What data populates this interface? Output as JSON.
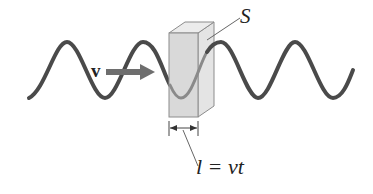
{
  "diagram": {
    "labels": {
      "velocity": "v",
      "surface": "S",
      "length_equation": "l = vt"
    },
    "colors": {
      "wave": "#4a4a4a",
      "wave_inside": "#8a8a8a",
      "arrow": "#6e6e6e",
      "box_front": "#d9d9d9",
      "box_side": "#e4e4e4",
      "box_top": "#ececec",
      "box_edge": "#8c8c8c",
      "leader_line": "#666666"
    }
  }
}
